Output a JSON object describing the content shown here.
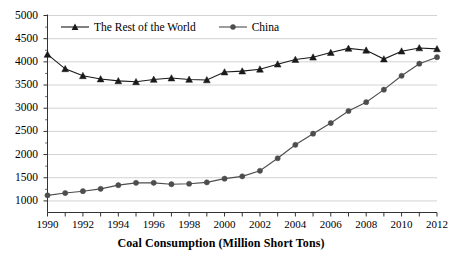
{
  "chart_data": {
    "type": "line",
    "title": "",
    "xlabel": "Coal Consumption (Million Short Tons)",
    "ylabel": "",
    "x": [
      1990,
      1991,
      1992,
      1993,
      1994,
      1995,
      1996,
      1997,
      1998,
      1999,
      2000,
      2001,
      2002,
      2003,
      2004,
      2005,
      2006,
      2007,
      2008,
      2009,
      2010,
      2011,
      2012
    ],
    "xlim": [
      1990,
      2012
    ],
    "ylim": [
      750,
      5000
    ],
    "yticks": [
      1000,
      1500,
      2000,
      2500,
      3000,
      3500,
      4000,
      4500,
      5000
    ],
    "xticks": [
      1990,
      1992,
      1994,
      1996,
      1998,
      2000,
      2002,
      2004,
      2006,
      2008,
      2010,
      2012
    ],
    "xtick_labels": [
      "1990",
      "1992",
      "1994",
      "1996",
      "1998",
      "2000",
      "2002",
      "2004",
      "2006",
      "2008",
      "2010",
      "2012"
    ],
    "ytick_labels": [
      "1000",
      "1500",
      "2000",
      "2500",
      "3000",
      "3500",
      "4000",
      "4500",
      "5000"
    ],
    "grid": true,
    "legend_position": "top-left-inside",
    "series": [
      {
        "name": "The Rest of the World",
        "marker": "triangle",
        "color": "#1a1a1a",
        "values": [
          4160,
          3850,
          3700,
          3630,
          3590,
          3570,
          3620,
          3650,
          3620,
          3610,
          3780,
          3800,
          3840,
          3950,
          4050,
          4100,
          4200,
          4290,
          4250,
          4060,
          4230,
          4300,
          4280
        ]
      },
      {
        "name": "China",
        "marker": "circle",
        "color": "#4d4d4d",
        "values": [
          1120,
          1170,
          1210,
          1260,
          1340,
          1390,
          1390,
          1360,
          1370,
          1400,
          1480,
          1530,
          1650,
          1920,
          2210,
          2450,
          2680,
          2940,
          3130,
          3400,
          3700,
          3960,
          4100
        ]
      }
    ]
  },
  "legend": {
    "items": [
      {
        "label": "The Rest of the World",
        "marker": "triangle",
        "color": "#1a1a1a"
      },
      {
        "label": "China",
        "marker": "circle",
        "color": "#4d4d4d"
      }
    ]
  },
  "axis": {
    "x_title": "Coal Consumption (Million Short Tons)"
  },
  "colors": {
    "gridline": "#c8c8c8",
    "axis": "#333333",
    "background": "#ffffff",
    "series_row": "#1a1a1a",
    "series_china": "#4d4d4d"
  }
}
